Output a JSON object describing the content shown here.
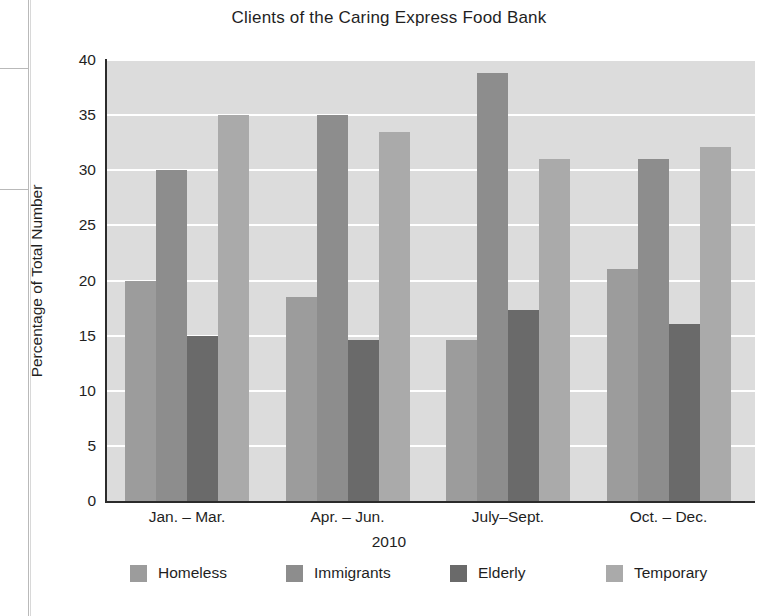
{
  "chart_data": {
    "type": "bar",
    "title": "Clients of the Caring Express Food Bank",
    "xlabel": "2010",
    "ylabel": "Percentage of Total Number",
    "categories": [
      "Jan. – Mar.",
      "Apr. – Jun.",
      "July–Sept.",
      "Oct. – Dec."
    ],
    "series": [
      {
        "name": "Homeless",
        "color": "#9c9c9c",
        "values": [
          20.0,
          18.5,
          14.6,
          21.0
        ]
      },
      {
        "name": "Immigrants",
        "color": "#8d8d8d",
        "values": [
          30.0,
          35.0,
          38.8,
          31.0
        ]
      },
      {
        "name": "Elderly",
        "color": "#6a6a6a",
        "values": [
          15.0,
          14.6,
          17.3,
          16.1
        ]
      },
      {
        "name": "Temporary",
        "color": "#aaaaaa",
        "values": [
          35.0,
          33.5,
          31.0,
          32.1
        ]
      }
    ],
    "ylim": [
      0,
      40
    ],
    "yticks": [
      0,
      5,
      10,
      15,
      20,
      25,
      30,
      35,
      40
    ],
    "ytick_labels": [
      "0",
      "5",
      "10",
      "15",
      "20",
      "25",
      "30",
      "35",
      "40"
    ],
    "grid": "horizontal-white",
    "legend_position": "bottom",
    "plot_background": "#dcdcdc",
    "axis_color": "#2b2b2b"
  }
}
